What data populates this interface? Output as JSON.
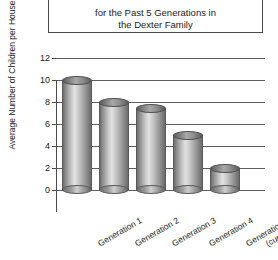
{
  "chart_data": {
    "type": "bar",
    "title_lines": [
      "for the Past 5 Generations in",
      "the Dexter Family"
    ],
    "xlabel": "",
    "ylabel": "Average Number of Children per Household",
    "ylim": [
      0,
      12
    ],
    "ytick_labels": [
      "0",
      "2",
      "4",
      "6",
      "8",
      "10",
      "12"
    ],
    "ytick_values": [
      0,
      2,
      4,
      6,
      8,
      10,
      12
    ],
    "grid": true,
    "legend": false,
    "categories": [
      "Generation 1",
      "Generation 2",
      "Generation 3",
      "Generation 4",
      "Generation 5 (current)"
    ],
    "category_lines": [
      [
        "Generation 1"
      ],
      [
        "Generation 2"
      ],
      [
        "Generation 3"
      ],
      [
        "Generation 4"
      ],
      [
        "Generation 5",
        "(current)"
      ]
    ],
    "values": [
      10,
      8,
      7.5,
      5,
      2
    ],
    "bar_style": "3d-cylinder",
    "bar_color": "#b0b0b0",
    "grid_color": "#5d5d5d",
    "axis_color": "#4a4a4a"
  }
}
